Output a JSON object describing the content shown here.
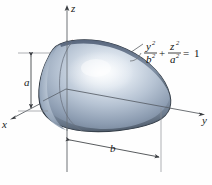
{
  "figure": {
    "kind": "3d-solid-of-revolution-diagram",
    "background_color": "#fefefe",
    "axes": {
      "z": {
        "label": "z",
        "icon": "axis-arrow-up"
      },
      "x": {
        "label": "x",
        "icon": "axis-arrow-down-left"
      },
      "y": {
        "label": "y",
        "icon": "axis-arrow-right"
      },
      "line_color": "#55585c",
      "origin_tick_color": "#b0554a"
    },
    "dimensions": [
      {
        "name": "a",
        "label": "a",
        "orientation": "vertical",
        "description": "semi-axis along z from origin to top of solid"
      },
      {
        "name": "b",
        "label": "b",
        "orientation": "horizontal",
        "description": "semi-axis along y from z-axis to right tip of solid"
      }
    ],
    "equation": {
      "numerator_1": "y",
      "denominator_1": "b",
      "numerator_2": "z",
      "denominator_2": "a",
      "superscript": "2",
      "plus": "+",
      "equals": "=",
      "right_side": "1",
      "full_text": "y²/b² + z²/a² = 1",
      "leader": "curved-leader-line"
    },
    "solid": {
      "name": "ellipsoid-solid",
      "fill_light": "#eef2f7",
      "fill_mid": "#9fafc4",
      "fill_dark": "#5d6c80",
      "rim_color": "#3d4754",
      "outline_color": "#2f3740",
      "highlight_color": "#f4f7fb"
    }
  }
}
